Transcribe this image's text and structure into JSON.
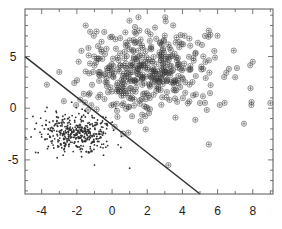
{
  "chart_data": {
    "type": "scatter",
    "title": "",
    "xlabel": "",
    "ylabel": "",
    "xlim": [
      -4.95,
      9.15
    ],
    "ylim": [
      -8.3,
      9.6
    ],
    "grid": false,
    "legend": null,
    "x_ticks": [
      -4,
      -2,
      0,
      2,
      4,
      6,
      8
    ],
    "x_tick_labels": [
      "-4",
      "-2",
      "0",
      "2",
      "4",
      "6",
      "8"
    ],
    "y_ticks": [
      5,
      0,
      -5
    ],
    "y_tick_labels": [
      "5",
      "0",
      "-5"
    ],
    "series": [
      {
        "name": "class +1",
        "marker": "circle-plus",
        "color": "#333333",
        "distribution": {
          "mean": [
            2.0,
            3.5
          ],
          "std": [
            1.9,
            2.1
          ],
          "n": 420,
          "seed": 7
        },
        "sample_points": [
          [
            -3.0,
            3.5
          ],
          [
            -1.9,
            4.5
          ],
          [
            -1.5,
            8.0
          ],
          [
            1.5,
            8.8
          ],
          [
            5.5,
            7.5
          ],
          [
            8.0,
            4.5
          ],
          [
            7.0,
            3.0
          ],
          [
            9.0,
            0.5
          ],
          [
            5.0,
            0.5
          ],
          [
            7.5,
            -1.5
          ],
          [
            5.5,
            -3.5
          ],
          [
            3.2,
            -5.5
          ],
          [
            2.0,
            0.0
          ]
        ]
      },
      {
        "name": "class -1",
        "marker": "dot",
        "color": "#333333",
        "distribution": {
          "mean": [
            -2.0,
            -2.4
          ],
          "std": [
            1.0,
            0.9
          ],
          "n": 420,
          "seed": 13
        },
        "sample_points": [
          [
            -4.5,
            -0.8
          ],
          [
            -3.8,
            -0.3
          ],
          [
            -4.2,
            -4.3
          ],
          [
            -1.0,
            -5.5
          ],
          [
            1.0,
            -5.8
          ],
          [
            0.5,
            -3.8
          ],
          [
            -2.0,
            -2.5
          ],
          [
            -2.5,
            -1.0
          ]
        ]
      }
    ],
    "annotations": [
      {
        "type": "line",
        "label": "decision boundary",
        "from": [
          -4.95,
          5.0
        ],
        "to": [
          5.0,
          -8.3
        ],
        "color": "#333333",
        "width": 1.5
      }
    ]
  }
}
